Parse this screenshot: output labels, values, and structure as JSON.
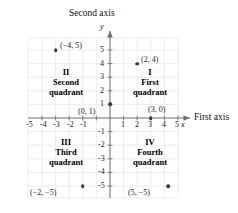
{
  "figure": {
    "type": "cartesian-plane",
    "axes": {
      "x_title": "First axis",
      "y_title": "Second axis",
      "x_var": "x",
      "y_var": "y",
      "x_ticks": [
        "-5",
        "-4",
        "-3",
        "-2",
        "-1",
        "1",
        "2",
        "3",
        "4",
        "5"
      ],
      "y_ticks_positive": [
        "5",
        "4",
        "3",
        "2",
        "1"
      ],
      "y_ticks_negative": [
        "-1",
        "-2",
        "-3",
        "-4",
        "-5"
      ],
      "x_range": [
        -6,
        6
      ],
      "y_range": [
        -6,
        6
      ],
      "grid": true
    },
    "quadrants": [
      {
        "numeral": "I",
        "word1": "First",
        "word2": "quadrant"
      },
      {
        "numeral": "II",
        "word1": "Second",
        "word2": "quadrant"
      },
      {
        "numeral": "III",
        "word1": "Third",
        "word2": "quadrant"
      },
      {
        "numeral": "IV",
        "word1": "Fourth",
        "word2": "quadrant"
      }
    ],
    "points": [
      {
        "label": "(−4, 5)",
        "x": -4,
        "y": 5
      },
      {
        "label": "(2, 4)",
        "x": 2,
        "y": 4
      },
      {
        "label": "(0, 1)",
        "x": 0,
        "y": 1
      },
      {
        "label": "(3, 0)",
        "x": 3,
        "y": 0
      },
      {
        "label": "(−2, −5)",
        "x": -2,
        "y": -5
      },
      {
        "label": "(5, −5)",
        "x": 5,
        "y": -5
      }
    ],
    "colors": {
      "grid": "#e9e9ec",
      "axis": "#6f6f76",
      "dot": "#3a3a3a",
      "text": "#1a1a1a",
      "background": "#ffffff"
    }
  }
}
